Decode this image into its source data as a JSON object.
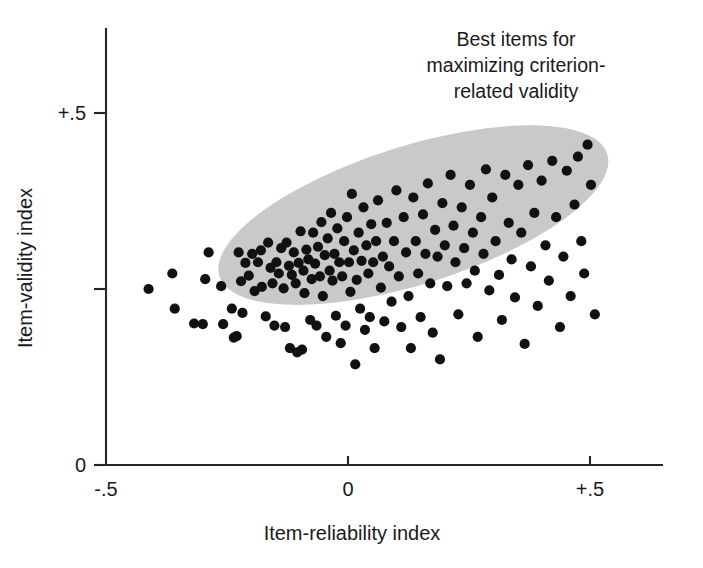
{
  "chart_data": {
    "type": "scatter",
    "title": "",
    "subtitle": "",
    "xlabel": "Item-reliability index",
    "ylabel": "Item-validity index",
    "xlim": [
      -0.5,
      0.62
    ],
    "ylim": [
      0.0,
      0.61
    ],
    "grid": false,
    "legend": null,
    "x_ticks": [
      {
        "value": -0.5,
        "label": "-.5"
      },
      {
        "value": 0.0,
        "label": "0"
      },
      {
        "value": 0.5,
        "label": "+.5"
      }
    ],
    "y_ticks": [
      {
        "value": 0.0,
        "label": "0"
      },
      {
        "value": 0.25,
        "label": ""
      },
      {
        "value": 0.5,
        "label": "+.5"
      }
    ],
    "annotations": [
      {
        "id": "best-items-callout",
        "lines": [
          "Best items for",
          "maximizing criterion-",
          "related validity"
        ],
        "text": "Best items for maximizing criterion-related validity",
        "x": 0.27,
        "y": 0.585,
        "align": "center"
      }
    ],
    "shapes": [
      {
        "id": "best-items-ellipse",
        "type": "ellipse",
        "fill": "#c9c9c9",
        "center_x": 0.135,
        "center_y": 0.355,
        "semi_major": 0.42,
        "semi_minor": 0.098,
        "rotation_deg": -17.5,
        "description": "Shaded region marking best items for maximizing criterion-related validity"
      }
    ],
    "series": [
      {
        "name": "Test items",
        "marker": "circle",
        "marker_color": "#111111",
        "marker_size_px": 5.1,
        "points": [
          [
            -0.412,
            0.25
          ],
          [
            -0.363,
            0.272
          ],
          [
            -0.358,
            0.222
          ],
          [
            -0.318,
            0.201
          ],
          [
            -0.3,
            0.2
          ],
          [
            -0.295,
            0.264
          ],
          [
            -0.288,
            0.302
          ],
          [
            -0.262,
            0.254
          ],
          [
            -0.258,
            0.2
          ],
          [
            -0.24,
            0.222
          ],
          [
            -0.236,
            0.181
          ],
          [
            -0.23,
            0.183
          ],
          [
            -0.226,
            0.302
          ],
          [
            -0.221,
            0.261
          ],
          [
            -0.218,
            0.216
          ],
          [
            -0.212,
            0.287
          ],
          [
            -0.205,
            0.269
          ],
          [
            -0.198,
            0.3
          ],
          [
            -0.193,
            0.247
          ],
          [
            -0.186,
            0.288
          ],
          [
            -0.18,
            0.305
          ],
          [
            -0.178,
            0.253
          ],
          [
            -0.17,
            0.211
          ],
          [
            -0.165,
            0.316
          ],
          [
            -0.16,
            0.28
          ],
          [
            -0.156,
            0.258
          ],
          [
            -0.152,
            0.198
          ],
          [
            -0.148,
            0.288
          ],
          [
            -0.143,
            0.272
          ],
          [
            -0.138,
            0.308
          ],
          [
            -0.133,
            0.251
          ],
          [
            -0.13,
            0.196
          ],
          [
            -0.127,
            0.316
          ],
          [
            -0.122,
            0.283
          ],
          [
            -0.12,
            0.166
          ],
          [
            -0.116,
            0.27
          ],
          [
            -0.112,
            0.302
          ],
          [
            -0.108,
            0.258
          ],
          [
            -0.105,
            0.16
          ],
          [
            -0.102,
            0.287
          ],
          [
            -0.098,
            0.332
          ],
          [
            -0.095,
            0.164
          ],
          [
            -0.092,
            0.276
          ],
          [
            -0.09,
            0.244
          ],
          [
            -0.086,
            0.306
          ],
          [
            -0.082,
            0.292
          ],
          [
            -0.078,
            0.206
          ],
          [
            -0.075,
            0.264
          ],
          [
            -0.072,
            0.33
          ],
          [
            -0.068,
            0.286
          ],
          [
            -0.065,
            0.198
          ],
          [
            -0.062,
            0.31
          ],
          [
            -0.058,
            0.268
          ],
          [
            -0.055,
            0.345
          ],
          [
            -0.052,
            0.24
          ],
          [
            -0.048,
            0.298
          ],
          [
            -0.045,
            0.182
          ],
          [
            -0.042,
            0.322
          ],
          [
            -0.038,
            0.276
          ],
          [
            -0.035,
            0.358
          ],
          [
            -0.032,
            0.262
          ],
          [
            -0.028,
            0.3
          ],
          [
            -0.025,
            0.212
          ],
          [
            -0.022,
            0.336
          ],
          [
            -0.018,
            0.288
          ],
          [
            -0.015,
            0.173
          ],
          [
            -0.012,
            0.268
          ],
          [
            -0.008,
            0.318
          ],
          [
            -0.005,
            0.198
          ],
          [
            -0.002,
            0.352
          ],
          [
            0.002,
            0.288
          ],
          [
            0.005,
            0.246
          ],
          [
            0.008,
            0.385
          ],
          [
            0.012,
            0.305
          ],
          [
            0.015,
            0.143
          ],
          [
            0.018,
            0.263
          ],
          [
            0.022,
            0.33
          ],
          [
            0.025,
            0.222
          ],
          [
            0.028,
            0.29
          ],
          [
            0.032,
            0.366
          ],
          [
            0.035,
            0.192
          ],
          [
            0.038,
            0.312
          ],
          [
            0.042,
            0.272
          ],
          [
            0.045,
            0.21
          ],
          [
            0.048,
            0.342
          ],
          [
            0.052,
            0.288
          ],
          [
            0.055,
            0.166
          ],
          [
            0.058,
            0.318
          ],
          [
            0.062,
            0.376
          ],
          [
            0.068,
            0.252
          ],
          [
            0.072,
            0.296
          ],
          [
            0.075,
            0.204
          ],
          [
            0.08,
            0.344
          ],
          [
            0.085,
            0.282
          ],
          [
            0.09,
            0.232
          ],
          [
            0.095,
            0.318
          ],
          [
            0.1,
            0.39
          ],
          [
            0.105,
            0.268
          ],
          [
            0.11,
            0.196
          ],
          [
            0.115,
            0.352
          ],
          [
            0.12,
            0.302
          ],
          [
            0.125,
            0.24
          ],
          [
            0.13,
            0.166
          ],
          [
            0.135,
            0.38
          ],
          [
            0.14,
            0.318
          ],
          [
            0.145,
            0.272
          ],
          [
            0.15,
            0.21
          ],
          [
            0.155,
            0.356
          ],
          [
            0.16,
            0.3
          ],
          [
            0.165,
            0.4
          ],
          [
            0.17,
            0.258
          ],
          [
            0.175,
            0.188
          ],
          [
            0.18,
            0.334
          ],
          [
            0.185,
            0.296
          ],
          [
            0.19,
            0.15
          ],
          [
            0.195,
            0.372
          ],
          [
            0.2,
            0.312
          ],
          [
            0.205,
            0.254
          ],
          [
            0.212,
            0.412
          ],
          [
            0.218,
            0.34
          ],
          [
            0.222,
            0.288
          ],
          [
            0.228,
            0.214
          ],
          [
            0.235,
            0.366
          ],
          [
            0.24,
            0.308
          ],
          [
            0.245,
            0.258
          ],
          [
            0.252,
            0.398
          ],
          [
            0.258,
            0.33
          ],
          [
            0.262,
            0.276
          ],
          [
            0.268,
            0.182
          ],
          [
            0.275,
            0.352
          ],
          [
            0.28,
            0.3
          ],
          [
            0.285,
            0.42
          ],
          [
            0.292,
            0.248
          ],
          [
            0.298,
            0.38
          ],
          [
            0.305,
            0.318
          ],
          [
            0.312,
            0.27
          ],
          [
            0.318,
            0.206
          ],
          [
            0.325,
            0.412
          ],
          [
            0.332,
            0.344
          ],
          [
            0.338,
            0.292
          ],
          [
            0.345,
            0.238
          ],
          [
            0.352,
            0.398
          ],
          [
            0.358,
            0.33
          ],
          [
            0.365,
            0.172
          ],
          [
            0.372,
            0.426
          ],
          [
            0.378,
            0.282
          ],
          [
            0.385,
            0.358
          ],
          [
            0.392,
            0.226
          ],
          [
            0.4,
            0.404
          ],
          [
            0.408,
            0.312
          ],
          [
            0.415,
            0.262
          ],
          [
            0.422,
            0.432
          ],
          [
            0.43,
            0.352
          ],
          [
            0.438,
            0.196
          ],
          [
            0.445,
            0.296
          ],
          [
            0.452,
            0.418
          ],
          [
            0.46,
            0.24
          ],
          [
            0.468,
            0.37
          ],
          [
            0.475,
            0.438
          ],
          [
            0.482,
            0.318
          ],
          [
            0.488,
            0.272
          ],
          [
            0.495,
            0.455
          ],
          [
            0.502,
            0.398
          ],
          [
            0.51,
            0.214
          ]
        ]
      }
    ]
  }
}
